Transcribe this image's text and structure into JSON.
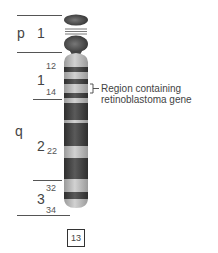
{
  "diagram": {
    "type": "chromosome-ideogram",
    "chromosome_number": "13",
    "arms": {
      "p": {
        "label": "p",
        "regions": [
          {
            "label": "1"
          }
        ]
      },
      "q": {
        "label": "q",
        "regions": [
          {
            "label": "1",
            "bands": [
              "12",
              "14"
            ]
          },
          {
            "label": "2",
            "bands": [
              "22"
            ]
          },
          {
            "label": "3",
            "bands": [
              "32",
              "34"
            ]
          }
        ]
      }
    },
    "annotation": {
      "line1": "Region containing",
      "line2": "retinoblastoma gene",
      "target_band": "q14"
    },
    "colors": {
      "dark_band": "#4a4a4a",
      "light_band": "#bdbdbd",
      "satellite": "#555555",
      "line": "#555555"
    }
  }
}
